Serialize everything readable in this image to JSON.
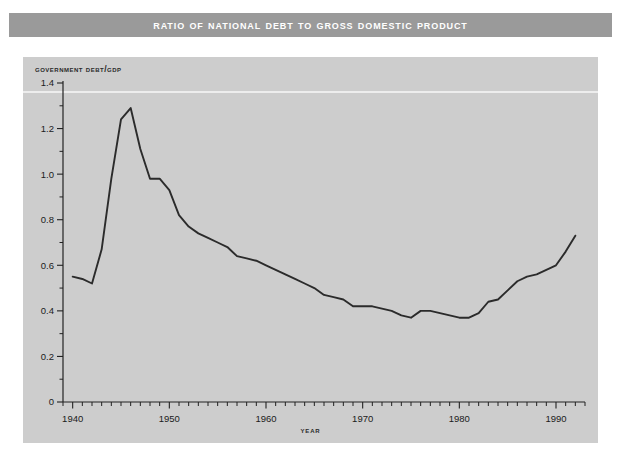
{
  "title": "Ratio of National Debt to Gross Domestic Product",
  "chart_data": {
    "type": "line",
    "title": "Ratio of National Debt to Gross Domestic Product",
    "xlabel": "Year",
    "ylabel": "Government debt/GDP",
    "xlim": [
      1939,
      1993
    ],
    "ylim": [
      0,
      1.4
    ],
    "grid": false,
    "legend": false,
    "y_ticks": [
      0,
      0.2,
      0.4,
      0.6,
      0.8,
      1.0,
      1.2,
      1.4
    ],
    "y_tick_labels": [
      "0",
      "0.2",
      "0.4",
      "0.6",
      "0.8",
      "1.0",
      "1.2",
      "1.4"
    ],
    "y_minor_step": 0.1,
    "x_ticks": [
      1940,
      1950,
      1960,
      1970,
      1980,
      1990
    ],
    "x_tick_labels": [
      "1940",
      "1950",
      "1960",
      "1970",
      "1980",
      "1990"
    ],
    "x_minor_step": 1,
    "series": [
      {
        "name": "Government debt/GDP",
        "x": [
          1940,
          1941,
          1942,
          1943,
          1944,
          1945,
          1946,
          1947,
          1948,
          1949,
          1950,
          1951,
          1952,
          1953,
          1954,
          1955,
          1956,
          1957,
          1958,
          1959,
          1960,
          1961,
          1962,
          1963,
          1964,
          1965,
          1966,
          1967,
          1968,
          1969,
          1970,
          1971,
          1972,
          1973,
          1974,
          1975,
          1976,
          1977,
          1978,
          1979,
          1980,
          1981,
          1982,
          1983,
          1984,
          1985,
          1986,
          1987,
          1988,
          1989,
          1990,
          1991,
          1992
        ],
        "y": [
          0.55,
          0.54,
          0.52,
          0.67,
          0.98,
          1.24,
          1.29,
          1.11,
          0.98,
          0.98,
          0.93,
          0.82,
          0.77,
          0.74,
          0.72,
          0.7,
          0.68,
          0.64,
          0.63,
          0.62,
          0.6,
          0.58,
          0.56,
          0.54,
          0.52,
          0.5,
          0.47,
          0.46,
          0.45,
          0.42,
          0.42,
          0.42,
          0.41,
          0.4,
          0.38,
          0.37,
          0.4,
          0.4,
          0.39,
          0.38,
          0.37,
          0.37,
          0.39,
          0.44,
          0.45,
          0.49,
          0.53,
          0.55,
          0.56,
          0.58,
          0.6,
          0.66,
          0.73
        ]
      }
    ]
  }
}
